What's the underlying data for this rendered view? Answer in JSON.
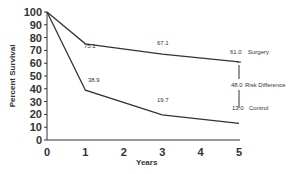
{
  "chart_data": {
    "type": "line",
    "title": "",
    "xlabel": "Years",
    "ylabel": "Percent Survival",
    "x": [
      0,
      1,
      3,
      5
    ],
    "xlim": [
      0,
      5
    ],
    "ylim": [
      0,
      100
    ],
    "xticks": [
      "0",
      "1",
      "2",
      "3",
      "4",
      "5"
    ],
    "yticks": [
      "0",
      "10",
      "20",
      "30",
      "40",
      "50",
      "60",
      "70",
      "80",
      "90",
      "100"
    ],
    "grid": false,
    "series": [
      {
        "name": "Surgery",
        "values": [
          100,
          75.1,
          67.1,
          61.0
        ]
      },
      {
        "name": "Control",
        "values": [
          100,
          38.9,
          19.7,
          13.0
        ]
      }
    ],
    "annotations": [
      {
        "text": "75.1",
        "x": 1,
        "y": 75.1
      },
      {
        "text": "67.1",
        "x": 3,
        "y": 67.1
      },
      {
        "text": "38.9",
        "x": 1,
        "y": 38.9
      },
      {
        "text": "19.7",
        "x": 3,
        "y": 19.7
      },
      {
        "text": "61.0",
        "x": 5,
        "y": 61.0
      },
      {
        "text": "Surgery",
        "x": 5,
        "y": 61.0
      },
      {
        "text": "48.0",
        "x": 5,
        "y": 37
      },
      {
        "text": "Risk Difference",
        "x": 5,
        "y": 37
      },
      {
        "text": "13.0",
        "x": 5,
        "y": 13.0
      },
      {
        "text": "Control",
        "x": 5,
        "y": 13.0
      }
    ]
  },
  "labels": {
    "xlabel": "Years",
    "ylabel": "Percent Survival",
    "surgery_value": "61.0",
    "surgery_name": "Surgery",
    "risk_value": "48.0",
    "risk_name": "Risk Difference",
    "control_value": "13.0",
    "control_name": "Control",
    "s1": "75.1",
    "s3": "67.1",
    "c1": "38.9",
    "c3": "19.7"
  }
}
